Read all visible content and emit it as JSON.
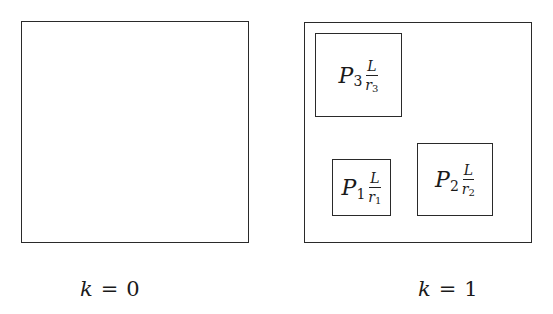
{
  "panels": [
    {
      "label": {
        "var": "k",
        "eq": "=",
        "value": "0"
      },
      "subregions": []
    },
    {
      "label": {
        "var": "k",
        "eq": "=",
        "value": "1"
      },
      "subregions": [
        {
          "P": "P",
          "index": "3",
          "numerator": "L",
          "denominator": "r",
          "den_index": "3"
        },
        {
          "P": "P",
          "index": "1",
          "numerator": "L",
          "denominator": "r",
          "den_index": "1"
        },
        {
          "P": "P",
          "index": "2",
          "numerator": "L",
          "denominator": "r",
          "den_index": "2"
        }
      ]
    }
  ]
}
